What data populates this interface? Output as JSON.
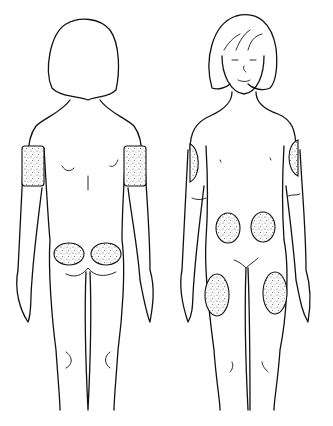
{
  "figure": {
    "title": "",
    "views": [
      {
        "id": "back",
        "label": ""
      },
      {
        "id": "front",
        "label": ""
      }
    ],
    "colors": {
      "line": "#111111",
      "stipple": "#9a9a9a",
      "background": "#ffffff"
    },
    "injection_sites": {
      "back": [
        {
          "name": "right-upper-arm-back",
          "type": "band",
          "x": 20,
          "y": 146,
          "w": 22,
          "h": 40
        },
        {
          "name": "left-upper-arm-back",
          "type": "band",
          "x": 124,
          "y": 146,
          "w": 22,
          "h": 40
        },
        {
          "name": "left-buttock",
          "type": "ellipse",
          "cx": 69,
          "cy": 254,
          "rx": 15,
          "ry": 11
        },
        {
          "name": "right-buttock",
          "type": "ellipse",
          "cx": 106,
          "cy": 254,
          "rx": 15,
          "ry": 11
        }
      ],
      "front": [
        {
          "name": "right-upper-arm-front",
          "type": "half",
          "cx": 192,
          "cy": 163,
          "rx": 9,
          "ry": 19
        },
        {
          "name": "left-upper-arm-front",
          "type": "half",
          "cx": 296,
          "cy": 157,
          "rx": 9,
          "ry": 19
        },
        {
          "name": "right-abdomen",
          "type": "ellipse",
          "cx": 228,
          "cy": 228,
          "rx": 12,
          "ry": 15
        },
        {
          "name": "left-abdomen",
          "type": "ellipse",
          "cx": 263,
          "cy": 227,
          "rx": 12,
          "ry": 15
        },
        {
          "name": "right-thigh",
          "type": "ellipse",
          "cx": 217,
          "cy": 295,
          "rx": 12,
          "ry": 21
        },
        {
          "name": "left-thigh",
          "type": "ellipse",
          "cx": 275,
          "cy": 293,
          "rx": 12,
          "ry": 21
        }
      ]
    }
  }
}
